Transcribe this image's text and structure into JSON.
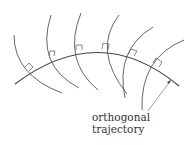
{
  "diagram": {
    "title": "Orthogonal trajectory",
    "labels": {
      "line1": "orthogonal",
      "line2": "trajectory"
    },
    "colors": {
      "stroke": "#444444",
      "text": "#333333",
      "background": "#ffffff"
    },
    "elements": {
      "trajectory": "orthogonal-trajectory-curve",
      "family_count": 6,
      "right_angle_markers": 6
    }
  }
}
